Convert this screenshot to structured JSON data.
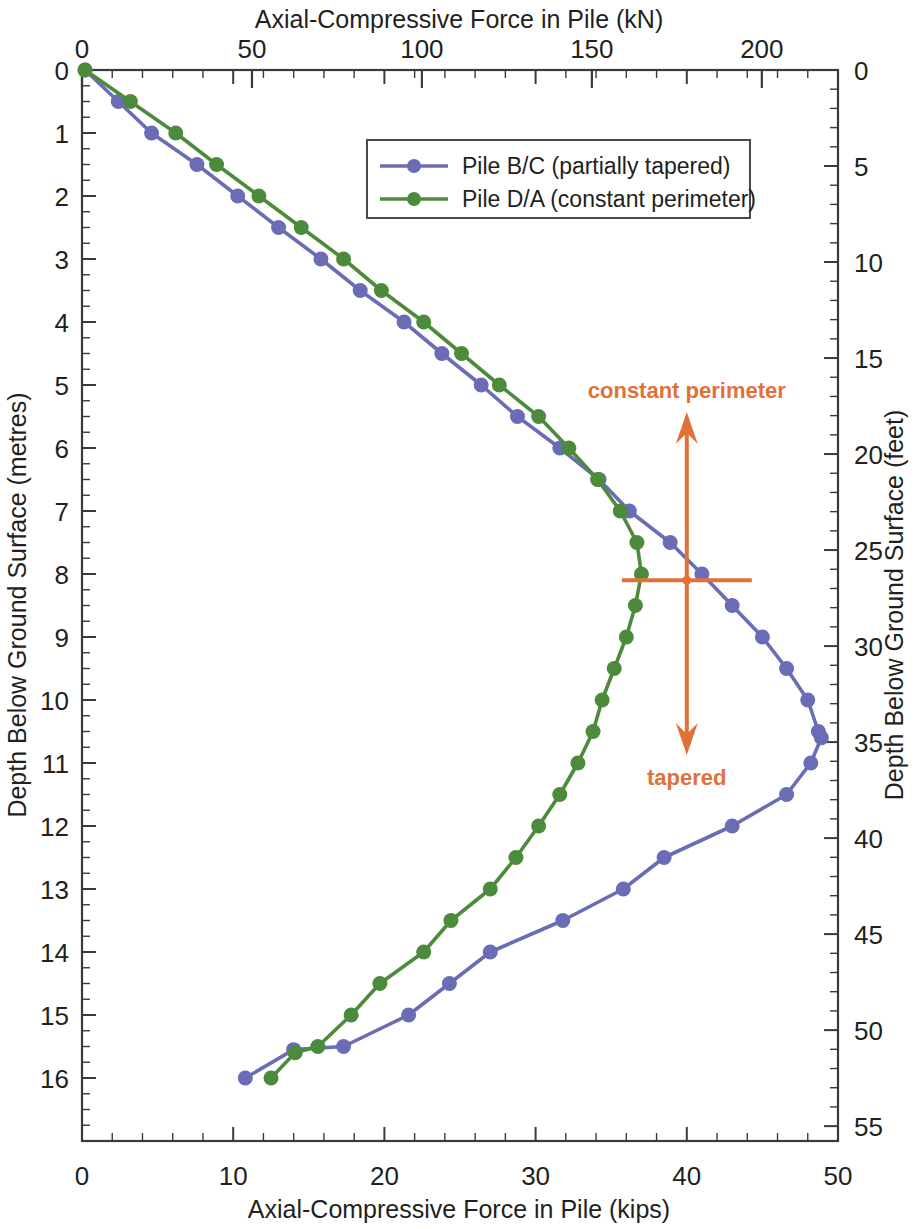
{
  "chart_data": {
    "type": "line",
    "title": "",
    "orientation": "depth-profile",
    "xlabel": "Axial-Compressive Force in Pile (kips)",
    "xlabel_top": "Axial-Compressive Force in Pile (kN)",
    "ylabel": "Depth Below Ground Surface (metres)",
    "ylabel_right": "Depth Below Ground Surface (feet)",
    "xlim": [
      0,
      50
    ],
    "xlim_top": [
      0,
      222.4
    ],
    "ylim": [
      0,
      17.0
    ],
    "ylim_right": [
      0,
      55.8
    ],
    "grid": false,
    "legend_position": "top-center",
    "axis_top_ticks": [
      0,
      50,
      100,
      150,
      200
    ],
    "axis_bottom_ticks": [
      0,
      10,
      20,
      30,
      40,
      50
    ],
    "axis_left_ticks": [
      0,
      1,
      2,
      3,
      4,
      5,
      6,
      7,
      8,
      9,
      10,
      11,
      12,
      13,
      14,
      15,
      16
    ],
    "axis_right_ticks": [
      0,
      5,
      10,
      15,
      20,
      25,
      30,
      35,
      40,
      45,
      50,
      55
    ],
    "series": [
      {
        "name": "Pile B/C (partially tapered)",
        "color": "#6a6cb5",
        "marker": "circle",
        "x": [
          0.2,
          2.4,
          4.6,
          7.6,
          10.3,
          13.0,
          15.8,
          18.4,
          21.3,
          23.8,
          26.4,
          28.8,
          31.6,
          34.2,
          36.2,
          38.9,
          41.0,
          43.0,
          45.0,
          46.6,
          48.0,
          48.7,
          48.9,
          48.2,
          46.6,
          43.0,
          38.5,
          35.8,
          31.8,
          27.0,
          24.3,
          21.6,
          17.3,
          14.0,
          10.8
        ],
        "y": [
          0.0,
          0.5,
          1.0,
          1.5,
          2.0,
          2.5,
          3.0,
          3.5,
          4.0,
          4.5,
          5.0,
          5.5,
          6.0,
          6.5,
          7.0,
          7.5,
          8.0,
          8.5,
          9.0,
          9.5,
          10.0,
          10.5,
          10.6,
          11.0,
          11.5,
          12.0,
          12.5,
          13.0,
          13.5,
          14.0,
          14.5,
          15.0,
          15.5,
          15.55,
          16.0
        ]
      },
      {
        "name": "Pile D/A (constant perimeter)",
        "color": "#4d8b3c",
        "marker": "circle",
        "x": [
          0.2,
          3.2,
          6.2,
          8.9,
          11.7,
          14.5,
          17.3,
          19.8,
          22.6,
          25.1,
          27.6,
          30.2,
          32.2,
          34.1,
          35.6,
          36.7,
          37.0,
          36.6,
          36.0,
          35.2,
          34.4,
          33.8,
          32.8,
          31.6,
          30.2,
          28.7,
          27.0,
          24.4,
          22.6,
          19.7,
          17.8,
          15.6,
          14.1,
          12.5
        ],
        "y": [
          0.0,
          0.5,
          1.0,
          1.5,
          2.0,
          2.5,
          3.0,
          3.5,
          4.0,
          4.5,
          5.0,
          5.5,
          6.0,
          6.5,
          7.0,
          7.5,
          8.0,
          8.5,
          9.0,
          9.5,
          10.0,
          10.5,
          11.0,
          11.5,
          12.0,
          12.5,
          13.0,
          13.5,
          14.0,
          14.5,
          15.0,
          15.5,
          15.6,
          16.0
        ]
      }
    ],
    "annotations": [
      {
        "text": "constant perimeter",
        "color": "#e2703a",
        "x": 40.0,
        "y": 6.0,
        "arrow": "up"
      },
      {
        "text": "tapered",
        "color": "#e2703a",
        "x": 40.0,
        "y": 10.1,
        "arrow": "down"
      }
    ],
    "annotation_marker": {
      "x": 40.0,
      "y": 8.1,
      "color": "#e2703a",
      "type": "crosshair"
    }
  },
  "legend": {
    "entries": [
      {
        "label": "Pile B/C (partially tapered)",
        "color": "#6a6cb5"
      },
      {
        "label": "Pile D/A (constant perimeter)",
        "color": "#4d8b3c"
      }
    ]
  },
  "axes": {
    "top_title": "Axial-Compressive Force in Pile (kN)",
    "bottom_title": "Axial-Compressive Force in Pile (kips)",
    "left_title": "Depth Below Ground Surface (metres)",
    "right_title": "Depth Below Ground Surface (feet)"
  }
}
